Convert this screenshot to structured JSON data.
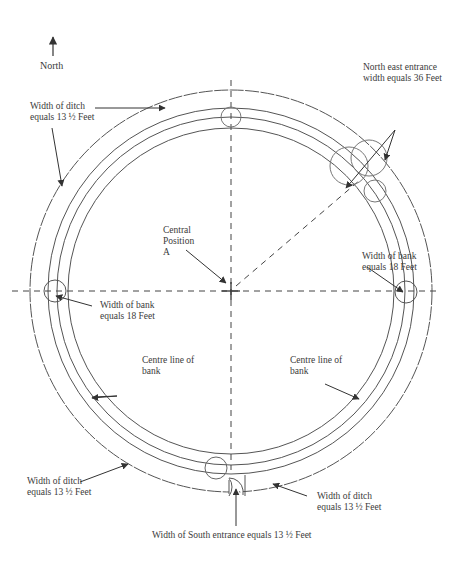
{
  "diagram": {
    "type": "henge plan",
    "compass": {
      "label": "North"
    },
    "center_label": {
      "line1": "Central",
      "line2": "Position",
      "line3": "A"
    },
    "labels": {
      "ditch_top_left": {
        "line1": "Width of ditch",
        "line2": "equals 13 ½ Feet"
      },
      "ne_entrance": {
        "line1": "North east entrance",
        "line2": "width equals 36 Feet"
      },
      "bank_right": {
        "line1": "Width of bank",
        "line2": "equals 18 Feet"
      },
      "bank_left": {
        "line1": "Width of bank",
        "line2": "equals 18 Feet"
      },
      "centre_line_left": {
        "line1": "Centre line of",
        "line2": "bank"
      },
      "centre_line_right": {
        "line1": "Centre line of",
        "line2": "bank"
      },
      "ditch_bottom_left": {
        "line1": "Width of ditch",
        "line2": "equals 13 ½ Feet"
      },
      "ditch_bottom_right": {
        "line1": "Width of ditch",
        "line2": "equals 13 ½ Feet"
      },
      "south_entrance": {
        "text": "Width of South entrance equals 13 ½ Feet"
      }
    },
    "colors": {
      "line": "#555555",
      "text": "#3a3a3a",
      "background": "#ffffff"
    }
  }
}
